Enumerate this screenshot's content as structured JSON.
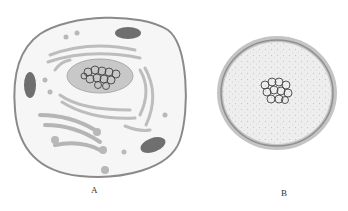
{
  "figure": {
    "cells": [
      {
        "id": "A",
        "label": "A",
        "type": "eukaryotic-cell"
      },
      {
        "id": "B",
        "label": "B",
        "type": "prokaryotic-like-cell"
      }
    ],
    "colors": {
      "membrane": "#8a8a8a",
      "cytoplasm": "#f4f4f4",
      "organelle": "#bdbdbd",
      "nucleus": "#c8c8c8",
      "chromatin": "#444444",
      "mitochondria": "#6f6f6f",
      "cellB_wall": "#bbbbbb",
      "cellB_fill": "#eeeeee"
    }
  }
}
